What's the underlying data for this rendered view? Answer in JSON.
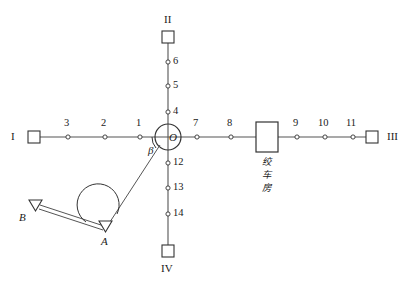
{
  "diagram": {
    "colors": {
      "line": "#555555",
      "stroke": "#333333",
      "text": "#1a1a1a",
      "background": "#ffffff"
    },
    "branch_labels": {
      "west": "I",
      "north": "II",
      "east": "III",
      "south": "IV"
    },
    "center_point": {
      "label": "O",
      "angle_label": "β"
    },
    "control_points": [
      {
        "label": "A"
      },
      {
        "label": "B"
      }
    ],
    "structure": {
      "winch_house_label": "绞车房",
      "winch_house_chars": [
        "绞",
        "车",
        "房"
      ]
    },
    "station_points": {
      "west_branch": [
        "3",
        "2",
        "1"
      ],
      "north_branch": [
        "6",
        "5",
        "4"
      ],
      "east_branch": [
        "7",
        "8",
        "9",
        "10",
        "11"
      ],
      "south_branch": [
        "12",
        "13",
        "14"
      ]
    },
    "stations": [
      {
        "id": "1",
        "x": 140,
        "y": 137,
        "label_x": 136,
        "label_y": 118,
        "branch": "west"
      },
      {
        "id": "2",
        "x": 105,
        "y": 137,
        "label_x": 101,
        "label_y": 118,
        "branch": "west"
      },
      {
        "id": "3",
        "x": 68,
        "y": 137,
        "label_x": 64,
        "label_y": 118,
        "branch": "west"
      },
      {
        "id": "4",
        "x": 168,
        "y": 112,
        "label_x": 173,
        "label_y": 106,
        "branch": "north"
      },
      {
        "id": "5",
        "x": 168,
        "y": 86,
        "label_x": 173,
        "label_y": 80,
        "branch": "north"
      },
      {
        "id": "6",
        "x": 168,
        "y": 62,
        "label_x": 173,
        "label_y": 56,
        "branch": "north"
      },
      {
        "id": "7",
        "x": 197,
        "y": 137,
        "label_x": 193,
        "label_y": 118,
        "branch": "east"
      },
      {
        "id": "8",
        "x": 231,
        "y": 137,
        "label_x": 227,
        "label_y": 118,
        "branch": "east"
      },
      {
        "id": "9",
        "x": 297,
        "y": 137,
        "label_x": 293,
        "label_y": 118,
        "branch": "east"
      },
      {
        "id": "10",
        "x": 325,
        "y": 137,
        "label_x": 318,
        "label_y": 118,
        "branch": "east"
      },
      {
        "id": "11",
        "x": 353,
        "y": 137,
        "label_x": 346,
        "label_y": 118,
        "branch": "east"
      },
      {
        "id": "12",
        "x": 168,
        "y": 163,
        "label_x": 173,
        "label_y": 157,
        "branch": "south"
      },
      {
        "id": "13",
        "x": 168,
        "y": 188,
        "label_x": 173,
        "label_y": 182,
        "branch": "south"
      },
      {
        "id": "14",
        "x": 168,
        "y": 214,
        "label_x": 173,
        "label_y": 208,
        "branch": "south"
      }
    ]
  }
}
